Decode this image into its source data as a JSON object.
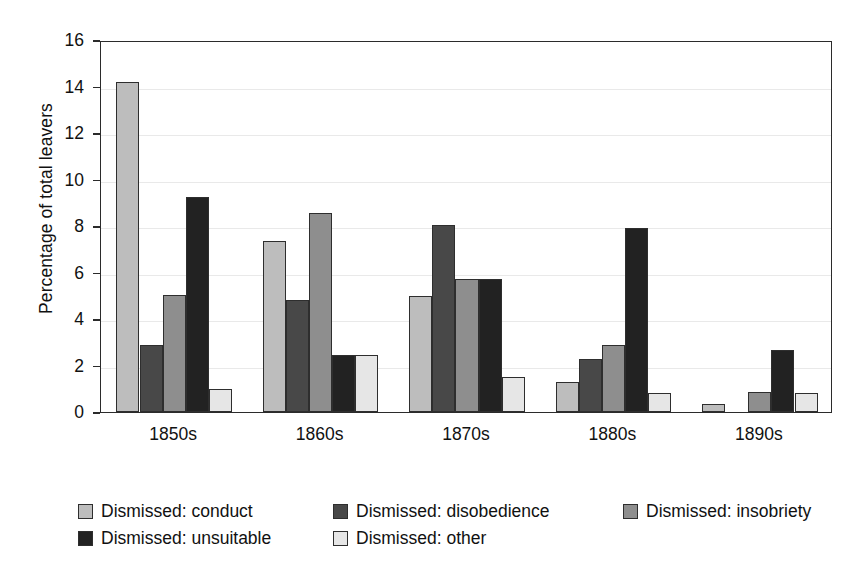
{
  "chart_data": {
    "type": "bar",
    "title": "",
    "subtitle": "",
    "xlabel": "",
    "ylabel": "Percentage of total leavers",
    "categories": [
      "1850s",
      "1860s",
      "1870s",
      "1880s",
      "1890s"
    ],
    "series": [
      {
        "name": "Dismissed: conduct",
        "key": "conduct",
        "color": "#bdbdbd",
        "values": [
          14.2,
          7.35,
          5.0,
          1.3,
          0.35
        ]
      },
      {
        "name": "Dismissed: disobedience",
        "key": "disobedience",
        "color": "#484848",
        "values": [
          2.9,
          4.8,
          8.05,
          2.3,
          0.0
        ]
      },
      {
        "name": "Dismissed: insobriety",
        "key": "insobriety",
        "color": "#8e8e8e",
        "values": [
          5.05,
          8.55,
          5.7,
          2.9,
          0.85
        ]
      },
      {
        "name": "Dismissed: unsuitable",
        "key": "unsuitable",
        "color": "#222222",
        "values": [
          9.25,
          2.45,
          5.7,
          7.9,
          2.65
        ]
      },
      {
        "name": "Dismissed: other",
        "key": "other",
        "color": "#e6e6e6",
        "values": [
          1.0,
          2.45,
          1.5,
          0.8,
          0.8
        ]
      }
    ],
    "ylim": [
      0,
      16
    ],
    "yticks": [
      0,
      2,
      4,
      6,
      8,
      10,
      12,
      14,
      16
    ],
    "ytick_labels": [
      "0",
      "2",
      "4",
      "6",
      "8",
      "10",
      "12",
      "14",
      "16"
    ],
    "grid": true,
    "grid_axis": "y",
    "legend_position": "bottom-left",
    "legend_columns": 3,
    "frame": true,
    "background_color": "#ffffff",
    "axis_color": "#2b2b2b",
    "grid_color": "#e9e9e9"
  },
  "legend": {
    "rows": [
      [
        {
          "label": "Dismissed: conduct",
          "swatch": "sw-conduct",
          "width": 255
        },
        {
          "label": "Dismissed: disobedience",
          "swatch": "sw-disobedience",
          "width": 290
        },
        {
          "label": "Dismissed: insobriety",
          "swatch": "sw-insobriety",
          "width": 225
        }
      ],
      [
        {
          "label": "Dismissed: unsuitable",
          "swatch": "sw-unsuitable",
          "width": 255
        },
        {
          "label": "Dismissed: other",
          "swatch": "sw-other",
          "width": 225
        }
      ]
    ]
  }
}
